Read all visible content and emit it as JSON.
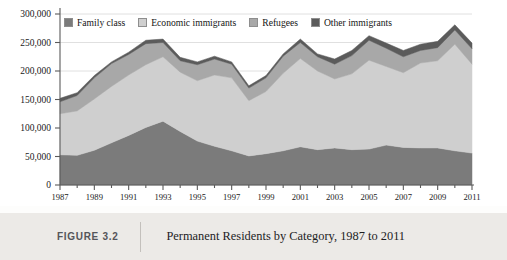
{
  "caption": {
    "figure_number": "FIGURE 3.2",
    "title": "Permanent Residents by Category, 1987 to 2011"
  },
  "chart_data": {
    "type": "area",
    "stacked": true,
    "title": "Permanent Residents by Category, 1987 to 2011",
    "xlabel": "",
    "ylabel": "",
    "xlim": [
      1987,
      2011
    ],
    "ylim": [
      0,
      300000
    ],
    "grid": true,
    "legend_position": "top-left",
    "y_ticks": [
      0,
      50000,
      100000,
      150000,
      200000,
      250000,
      300000
    ],
    "y_tick_labels": [
      "0",
      "50,000",
      "100,000",
      "150,000",
      "200,000",
      "250,000",
      "300,000"
    ],
    "x": [
      1987,
      1988,
      1989,
      1990,
      1991,
      1992,
      1993,
      1994,
      1995,
      1996,
      1997,
      1998,
      1999,
      2000,
      2001,
      2002,
      2003,
      2004,
      2005,
      2006,
      2007,
      2008,
      2009,
      2010,
      2011
    ],
    "x_tick_labels": [
      "1987",
      "1989",
      "1991",
      "1993",
      "1995",
      "1997",
      "1999",
      "2001",
      "2003",
      "2005",
      "2007",
      "2009",
      "2011"
    ],
    "series": [
      {
        "name": "Family class",
        "color": "#7b7b7b",
        "values": [
          53000,
          52000,
          61000,
          74000,
          87000,
          101000,
          112000,
          94000,
          77000,
          68000,
          60000,
          51000,
          55000,
          60000,
          67000,
          62000,
          65000,
          62000,
          63000,
          70000,
          66000,
          65000,
          65000,
          60000,
          56000
        ]
      },
      {
        "name": "Economic immigrants",
        "color": "#cfcfcf",
        "values": [
          72000,
          78000,
          90000,
          99000,
          106000,
          110000,
          113000,
          104000,
          106000,
          125000,
          128000,
          97000,
          109000,
          136000,
          155000,
          138000,
          121000,
          133000,
          156000,
          138000,
          131000,
          149000,
          153000,
          187000,
          156000
        ]
      },
      {
        "name": "Refugees",
        "color": "#a8a8a8",
        "values": [
          21000,
          27000,
          37000,
          40000,
          36000,
          37000,
          25000,
          20000,
          28000,
          28000,
          24000,
          22000,
          24000,
          30000,
          28000,
          25000,
          26000,
          32000,
          35000,
          32000,
          28000,
          22000,
          23000,
          25000,
          27000
        ]
      },
      {
        "name": "Other immigrants",
        "color": "#5b5b5b",
        "values": [
          6000,
          5000,
          4000,
          3000,
          4000,
          6000,
          6000,
          6000,
          5000,
          5000,
          4000,
          4000,
          4000,
          4000,
          6000,
          5000,
          9000,
          9000,
          8000,
          9000,
          11000,
          11000,
          11000,
          9000,
          10000
        ]
      }
    ],
    "totals": [
      152000,
      162000,
      192000,
      216000,
      233000,
      254000,
      256000,
      224000,
      216000,
      226000,
      216000,
      174000,
      192000,
      230000,
      256000,
      230000,
      221000,
      236000,
      262000,
      249000,
      236000,
      247000,
      252000,
      281000,
      249000
    ]
  },
  "legend": {
    "items": [
      {
        "label": "Family class",
        "color": "#7b7b7b"
      },
      {
        "label": "Economic immigrants",
        "color": "#cfcfcf"
      },
      {
        "label": "Refugees",
        "color": "#a8a8a8"
      },
      {
        "label": "Other immigrants",
        "color": "#5b5b5b"
      }
    ]
  }
}
